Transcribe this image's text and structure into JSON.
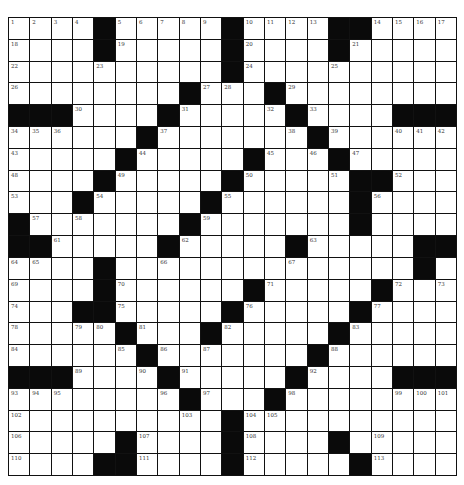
{
  "puzzle": {
    "rows": 21,
    "cols": 21,
    "block_color": "#0a0a0a",
    "cell_color": "#ffffff",
    "grid": [
      "....#.....#....##....",
      "....#.....#....#.....",
      "..........#..........",
      "........#...#........",
      "###....#.....#....###",
      "......#.......#......",
      ".....#.....#...#.....",
      "....#.....#.....##...",
      "...#.....#......#....",
      "#.......#.......#....",
      "##.....#.....#.....##",
      "....#..............#",
      "....#......#.....#...",
      "...##.....#.....#....",
      ".....#...#.....#.....",
      "......#.......#......",
      "###....#.....#....###",
      "........#...#........",
      "..........#..........",
      ".....#....#....#....",
      "....##....#.....#...."
    ],
    "numbers": [
      [
        0,
        0,
        1
      ],
      [
        0,
        1,
        2
      ],
      [
        0,
        2,
        3
      ],
      [
        0,
        3,
        4
      ],
      [
        0,
        5,
        5
      ],
      [
        0,
        6,
        6
      ],
      [
        0,
        7,
        7
      ],
      [
        0,
        8,
        8
      ],
      [
        0,
        9,
        9
      ],
      [
        0,
        11,
        10
      ],
      [
        0,
        12,
        11
      ],
      [
        0,
        13,
        12
      ],
      [
        0,
        14,
        13
      ],
      [
        0,
        17,
        14
      ],
      [
        0,
        18,
        15
      ],
      [
        0,
        19,
        16
      ],
      [
        0,
        20,
        17
      ],
      [
        1,
        0,
        18
      ],
      [
        1,
        5,
        19
      ],
      [
        1,
        11,
        20
      ],
      [
        1,
        16,
        21
      ],
      [
        2,
        0,
        22
      ],
      [
        2,
        4,
        23
      ],
      [
        2,
        11,
        24
      ],
      [
        2,
        15,
        25
      ],
      [
        3,
        0,
        26
      ],
      [
        3,
        9,
        27
      ],
      [
        3,
        10,
        28
      ],
      [
        3,
        13,
        29
      ],
      [
        4,
        3,
        30
      ],
      [
        4,
        8,
        31
      ],
      [
        4,
        12,
        32
      ],
      [
        4,
        14,
        33
      ],
      [
        5,
        0,
        34
      ],
      [
        5,
        1,
        35
      ],
      [
        5,
        2,
        36
      ],
      [
        5,
        7,
        37
      ],
      [
        5,
        13,
        38
      ],
      [
        5,
        15,
        39
      ],
      [
        5,
        18,
        40
      ],
      [
        5,
        19,
        41
      ],
      [
        5,
        20,
        42
      ],
      [
        6,
        0,
        43
      ],
      [
        6,
        6,
        44
      ],
      [
        6,
        12,
        45
      ],
      [
        6,
        14,
        46
      ],
      [
        6,
        16,
        47
      ],
      [
        7,
        0,
        48
      ],
      [
        7,
        5,
        49
      ],
      [
        7,
        11,
        50
      ],
      [
        7,
        15,
        51
      ],
      [
        7,
        18,
        52
      ],
      [
        8,
        0,
        53
      ],
      [
        8,
        4,
        54
      ],
      [
        8,
        10,
        55
      ],
      [
        8,
        17,
        56
      ],
      [
        9,
        1,
        57
      ],
      [
        9,
        3,
        58
      ],
      [
        9,
        9,
        59
      ],
      [
        9,
        16,
        60
      ],
      [
        10,
        2,
        61
      ],
      [
        10,
        8,
        62
      ],
      [
        10,
        14,
        63
      ],
      [
        11,
        0,
        64
      ],
      [
        11,
        1,
        65
      ],
      [
        11,
        7,
        66
      ],
      [
        11,
        13,
        67
      ],
      [
        11,
        19,
        68
      ],
      [
        12,
        0,
        69
      ],
      [
        12,
        5,
        70
      ],
      [
        12,
        12,
        71
      ],
      [
        12,
        18,
        72
      ],
      [
        12,
        20,
        73
      ],
      [
        13,
        0,
        74
      ],
      [
        13,
        5,
        75
      ],
      [
        13,
        11,
        76
      ],
      [
        13,
        17,
        77
      ],
      [
        14,
        0,
        78
      ],
      [
        14,
        3,
        79
      ],
      [
        14,
        4,
        80
      ],
      [
        14,
        6,
        81
      ],
      [
        14,
        10,
        82
      ],
      [
        14,
        16,
        83
      ],
      [
        15,
        0,
        84
      ],
      [
        15,
        5,
        85
      ],
      [
        15,
        7,
        86
      ],
      [
        15,
        9,
        87
      ],
      [
        15,
        15,
        88
      ],
      [
        16,
        3,
        89
      ],
      [
        16,
        6,
        90
      ],
      [
        16,
        8,
        91
      ],
      [
        16,
        14,
        92
      ],
      [
        17,
        0,
        93
      ],
      [
        17,
        1,
        94
      ],
      [
        17,
        2,
        95
      ],
      [
        17,
        7,
        96
      ],
      [
        17,
        9,
        97
      ],
      [
        17,
        13,
        98
      ],
      [
        17,
        18,
        99
      ],
      [
        17,
        19,
        100
      ],
      [
        17,
        20,
        101
      ],
      [
        18,
        0,
        102
      ],
      [
        18,
        8,
        103
      ],
      [
        18,
        11,
        104
      ],
      [
        18,
        12,
        105
      ],
      [
        19,
        0,
        106
      ],
      [
        19,
        6,
        107
      ],
      [
        19,
        11,
        108
      ],
      [
        19,
        17,
        109
      ],
      [
        20,
        0,
        110
      ],
      [
        20,
        6,
        111
      ],
      [
        20,
        11,
        112
      ],
      [
        20,
        17,
        113
      ]
    ]
  }
}
